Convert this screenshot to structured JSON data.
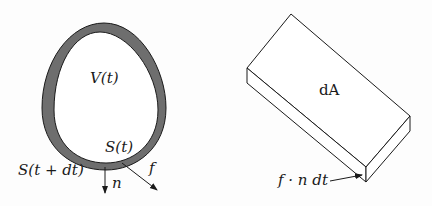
{
  "figure": {
    "left_panel": {
      "description": "egg-shaped control volume with boundary shell",
      "labels": {
        "volume": "V(t)",
        "surface_inner": "S(t)",
        "surface_outer": "S(t + dt)",
        "normal": "n",
        "flux": "f"
      },
      "colors": {
        "shell_fill": "#6e6e6e",
        "stroke": "#1a1a1a",
        "interior": "#ffffff"
      }
    },
    "right_panel": {
      "description": "thin slab over surface element",
      "labels": {
        "area": "dA",
        "thickness": "f · n dt"
      }
    }
  }
}
